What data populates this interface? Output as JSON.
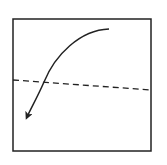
{
  "diagram": {
    "frame": {
      "x": 13,
      "y": 19,
      "width": 138,
      "height": 132,
      "stroke": "#222222"
    },
    "dashed_line": {
      "x1": 13,
      "y1": 80,
      "x2": 151,
      "y2": 90,
      "stroke": "#222222",
      "dasharray": "6,4"
    },
    "curved_arrow": {
      "path": "M 109 29 C 80 30, 55 55, 44 82 C 37 98, 31 108, 27 118",
      "stroke": "#222222",
      "head": {
        "tip_x": 26,
        "tip_y": 120
      }
    }
  }
}
